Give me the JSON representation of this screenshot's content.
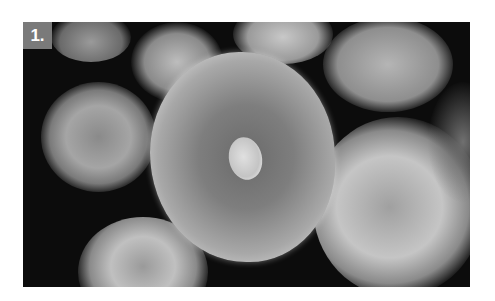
{
  "figure": {
    "label": "1.",
    "colors": {
      "background": "#0c0c0c",
      "badge": "#7a7a7a",
      "badge_text": "#ffffff"
    }
  }
}
